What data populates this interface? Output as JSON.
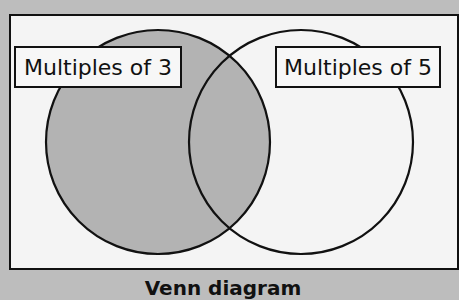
{
  "diagram": {
    "type": "venn",
    "sets": [
      {
        "label": "Multiples of 3",
        "shaded": true,
        "fill": "#b3b3b3"
      },
      {
        "label": "Multiples of 5",
        "shaded": false,
        "fill": "#f4f4f4"
      }
    ],
    "caption": "Venn diagram",
    "colors": {
      "background": "#bdbdbd",
      "frame_fill": "#f4f4f4",
      "stroke": "#111111",
      "shade": "#b3b3b3"
    }
  }
}
